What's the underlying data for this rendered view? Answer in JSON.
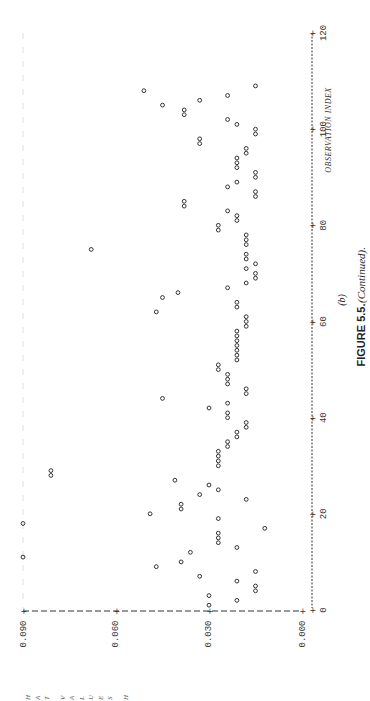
{
  "figure": {
    "caption_number": "FIGURE 5.5.",
    "caption_text": "(Continued).",
    "panel_label": "(b)"
  },
  "chart_data": {
    "type": "scatter",
    "title": "",
    "xlabel": "OBSERVATION INDEX",
    "ylabel": "HAT VALUES H",
    "rotation": "plot rotated 90° counter-clockwise on page",
    "xlim": [
      0,
      120
    ],
    "ylim": [
      0.0,
      0.09
    ],
    "x_ticks": [
      0,
      20,
      40,
      60,
      80,
      100,
      120
    ],
    "y_ticks": [
      0.0,
      0.03,
      0.06,
      0.09
    ],
    "y_tick_labels": [
      "0.000",
      "0.030",
      "0.060",
      "0.090"
    ],
    "x_tick_labels": [
      "0",
      "20",
      "40",
      "60",
      "80",
      "100",
      "120"
    ],
    "marker": "o",
    "grid": false,
    "legend": null,
    "series": [
      {
        "name": "H",
        "x": [
          1,
          2,
          3,
          4,
          5,
          6,
          7,
          8,
          9,
          10,
          11,
          12,
          13,
          14,
          15,
          16,
          17,
          18,
          19,
          20,
          21,
          22,
          23,
          24,
          25,
          26,
          27,
          28,
          29,
          30,
          31,
          32,
          33,
          34,
          35,
          36,
          37,
          38,
          39,
          40,
          41,
          42,
          43,
          44,
          45,
          46,
          47,
          48,
          49,
          50,
          51,
          52,
          53,
          54,
          55,
          56,
          57,
          58,
          59,
          60,
          61,
          62,
          63,
          64,
          65,
          66,
          67,
          68,
          69,
          70,
          71,
          72,
          73,
          74,
          75,
          76,
          77,
          78,
          79,
          80,
          81,
          82,
          83,
          84,
          85,
          86,
          87,
          88,
          89,
          90,
          91,
          92,
          93,
          94,
          95,
          96,
          97,
          98,
          99,
          100,
          101,
          102,
          103,
          104,
          105,
          106,
          107,
          108,
          109
        ],
        "values": [
          0.03,
          0.021,
          0.03,
          0.015,
          0.015,
          0.021,
          0.033,
          0.015,
          0.047,
          0.039,
          0.09,
          0.036,
          0.021,
          0.027,
          0.027,
          0.027,
          0.012,
          0.09,
          0.027,
          0.049,
          0.039,
          0.039,
          0.018,
          0.033,
          0.027,
          0.03,
          0.041,
          0.081,
          0.081,
          0.027,
          0.027,
          0.027,
          0.027,
          0.024,
          0.024,
          0.021,
          0.021,
          0.018,
          0.018,
          0.024,
          0.024,
          0.03,
          0.024,
          0.045,
          0.018,
          0.018,
          0.024,
          0.024,
          0.024,
          0.027,
          0.027,
          0.021,
          0.021,
          0.021,
          0.021,
          0.021,
          0.021,
          0.021,
          0.018,
          0.018,
          0.018,
          0.047,
          0.021,
          0.021,
          0.045,
          0.04,
          0.024,
          0.018,
          0.015,
          0.015,
          0.018,
          0.015,
          0.018,
          0.018,
          0.068,
          0.018,
          0.018,
          0.018,
          0.027,
          0.027,
          0.021,
          0.021,
          0.024,
          0.038,
          0.038,
          0.015,
          0.015,
          0.024,
          0.021,
          0.015,
          0.015,
          0.021,
          0.021,
          0.021,
          0.018,
          0.018,
          0.033,
          0.033,
          0.015,
          0.015,
          0.021,
          0.024,
          0.038,
          0.038,
          0.045,
          0.033,
          0.024,
          0.051,
          0.015
        ]
      }
    ]
  }
}
